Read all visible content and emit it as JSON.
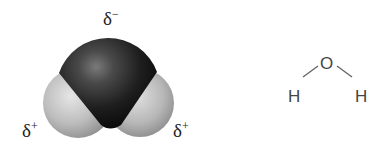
{
  "diagram": {
    "space_filling_model": {
      "oxygen_charge": {
        "symbol": "δ",
        "sign": "−"
      },
      "left_hydrogen_charge": {
        "symbol": "δ",
        "sign": "+"
      },
      "right_hydrogen_charge": {
        "symbol": "δ",
        "sign": "+"
      },
      "colors": {
        "oxygen": "#1a1a1a",
        "hydrogen": "#bdbdbd"
      }
    },
    "structural_formula": {
      "center_atom": "O",
      "left_atom": "H",
      "right_atom": "H",
      "bond_color": "#555555"
    }
  }
}
